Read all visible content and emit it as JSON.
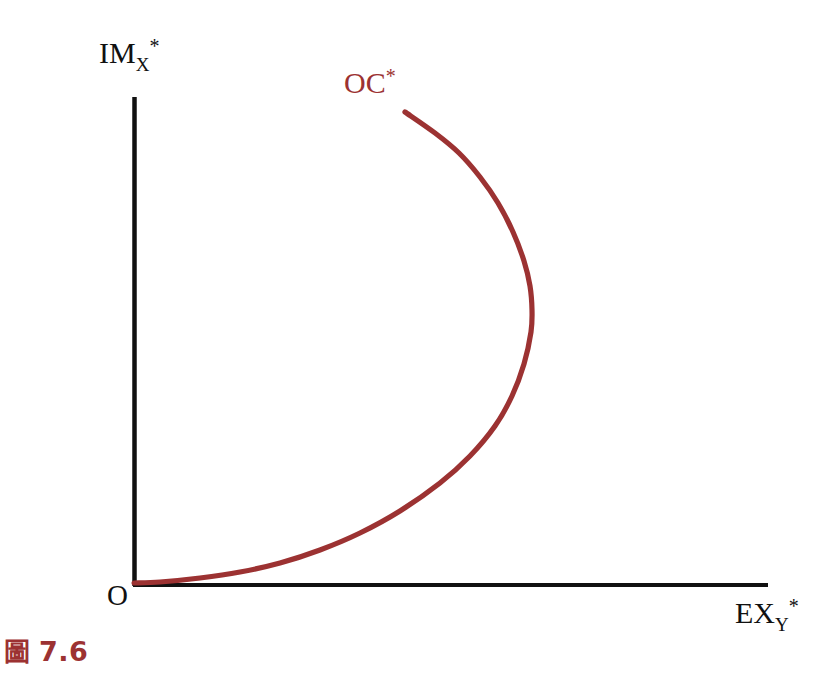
{
  "figure": {
    "caption_glyph": "圖",
    "caption_number": "7.6",
    "caption_glyph_name": "figure-cjk-glyph"
  },
  "axes": {
    "y": {
      "base": "IM",
      "subscript": "X",
      "superscript": "*",
      "full": "IM_X*"
    },
    "x": {
      "base": "EX",
      "subscript": "Y",
      "superscript": "*",
      "full": "EX_Y*"
    },
    "origin": "O"
  },
  "curve": {
    "base": "OC",
    "superscript": "*",
    "full": "OC*"
  },
  "colors": {
    "curve": "#9c3232",
    "axis": "#111111",
    "caption": "#9c3232",
    "background": "#ffffff"
  },
  "chart_data": {
    "type": "line",
    "title": "",
    "xlabel": "EX_Y*",
    "ylabel": "IM_X*",
    "grid": false,
    "legend": "none",
    "annotations": [
      {
        "text": "OC*",
        "x": 0.43,
        "y": 0.93,
        "color": "#9c3232"
      },
      {
        "text": "O",
        "x": 0.0,
        "y": 0.0,
        "color": "#111111"
      }
    ],
    "axis_origin_px": [
      133,
      585
    ],
    "axis_x_end_px": [
      768,
      585
    ],
    "axis_y_end_px": [
      133,
      97
    ],
    "xlim": [
      0,
      1
    ],
    "ylim": [
      0,
      1
    ],
    "series": [
      {
        "name": "OC*",
        "color": "#9c3232",
        "comment": "backward-bending offer curve of the foreign country",
        "points_px": [
          [
            134,
            583
          ],
          [
            160,
            582
          ],
          [
            200,
            578
          ],
          [
            240,
            572
          ],
          [
            280,
            563
          ],
          [
            320,
            550
          ],
          [
            360,
            533
          ],
          [
            400,
            511
          ],
          [
            440,
            483
          ],
          [
            470,
            456
          ],
          [
            495,
            426
          ],
          [
            512,
            396
          ],
          [
            524,
            364
          ],
          [
            531,
            332
          ],
          [
            532,
            310
          ],
          [
            530,
            286
          ],
          [
            524,
            261
          ],
          [
            513,
            232
          ],
          [
            498,
            203
          ],
          [
            480,
            177
          ],
          [
            459,
            153
          ],
          [
            435,
            133
          ],
          [
            405,
            112
          ]
        ],
        "x": [
          0.0,
          0.04,
          0.11,
          0.17,
          0.23,
          0.29,
          0.36,
          0.42,
          0.48,
          0.53,
          0.57,
          0.6,
          0.62,
          0.63,
          0.63,
          0.63,
          0.62,
          0.6,
          0.57,
          0.55,
          0.51,
          0.48,
          0.43
        ],
        "y": [
          0.0,
          0.0,
          0.01,
          0.03,
          0.05,
          0.07,
          0.11,
          0.15,
          0.21,
          0.26,
          0.33,
          0.39,
          0.45,
          0.52,
          0.56,
          0.61,
          0.66,
          0.72,
          0.78,
          0.84,
          0.89,
          0.93,
          0.97
        ]
      }
    ]
  }
}
